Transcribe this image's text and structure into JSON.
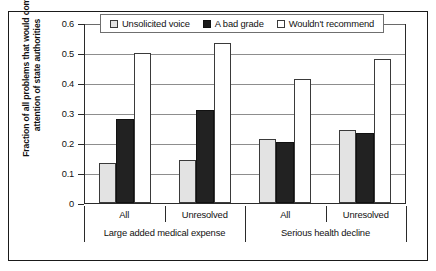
{
  "chart_data": {
    "type": "bar",
    "title": "",
    "xlabel": "",
    "ylabel": "Fraction of all problems that would come attention of state authorities",
    "ylim": [
      0,
      0.6
    ],
    "yticks": [
      "0",
      "0.1",
      "0.2",
      "0.3",
      "0.4",
      "0.5",
      "0.6"
    ],
    "grid": true,
    "legend_position": "top-center",
    "categories": [
      "All",
      "Unresolved",
      "All",
      "Unresolved"
    ],
    "supercategories": [
      "Large added medical expense",
      "Serious health decline"
    ],
    "series": [
      {
        "name": "Unsolicited voice",
        "values": [
          0.135,
          0.145,
          0.215,
          0.245
        ],
        "color": "#e3e3e3"
      },
      {
        "name": "A bad grade",
        "values": [
          0.28,
          0.31,
          0.205,
          0.235
        ],
        "color": "#222222"
      },
      {
        "name": "Wouldn't recommend",
        "values": [
          0.5,
          0.535,
          0.415,
          0.48
        ],
        "color": "#ffffff"
      }
    ]
  },
  "legend": {
    "items": [
      {
        "label": "Unsolicited voice"
      },
      {
        "label": "A bad grade"
      },
      {
        "label": "Wouldn't recommend"
      }
    ]
  },
  "axis": {
    "y_title": "Fraction of all problems that would come attention of state authorities",
    "y_tick_labels": [
      "0.6",
      "0.5",
      "0.4",
      "0.3",
      "0.2",
      "0.1",
      "0"
    ]
  },
  "xaxis": {
    "tier1": [
      "All",
      "Unresolved",
      "All",
      "Unresolved"
    ],
    "tier2": [
      "Large added medical expense",
      "Serious health decline"
    ]
  }
}
